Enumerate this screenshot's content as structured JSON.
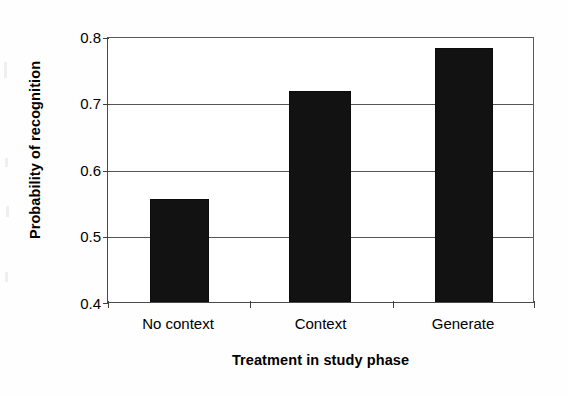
{
  "chart_data": {
    "type": "bar",
    "title": "",
    "subtitle": "",
    "xlabel": "Treatment in study phase",
    "ylabel": "Probability of recognition",
    "categories": [
      "No context",
      "Context",
      "Generate"
    ],
    "values": [
      0.556,
      0.72,
      0.785
    ],
    "series": [
      {
        "name": "Probability of recognition",
        "values": [
          0.556,
          0.72,
          0.785
        ],
        "color": "#121212"
      }
    ],
    "ylim": [
      0.4,
      0.8
    ],
    "yticks": [
      0.4,
      0.5,
      0.6,
      0.7,
      0.8
    ],
    "ytick_labels": [
      "0.4",
      "0.5",
      "0.6",
      "0.7",
      "0.8"
    ],
    "grid": true,
    "grid_axis": "y",
    "legend": false,
    "legend_position": "none",
    "annotations": [],
    "bar_color": "#121212",
    "axis_color": "#4a4a4a",
    "grid_color": "#565656",
    "background_color": "#ffffff"
  },
  "axes": {
    "y_title": "Probability of recognition",
    "x_title": "Treatment in study phase"
  }
}
